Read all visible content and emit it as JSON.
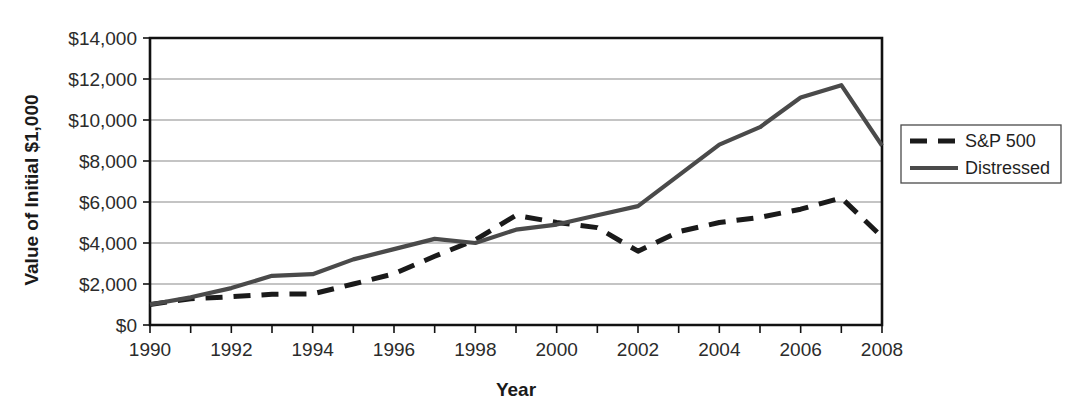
{
  "chart_data": {
    "type": "line",
    "title": "",
    "xlabel": "Year",
    "ylabel": "Value of Initial $1,000",
    "xlim": [
      1990,
      2008
    ],
    "ylim": [
      0,
      14000
    ],
    "grid": true,
    "legend_position": "right",
    "x": [
      1990,
      1991,
      1992,
      1993,
      1994,
      1995,
      1996,
      1997,
      1998,
      1999,
      2000,
      2001,
      2002,
      2003,
      2004,
      2005,
      2006,
      2007,
      2008
    ],
    "xtick_labels": [
      "1990",
      "1992",
      "1994",
      "1996",
      "1998",
      "2000",
      "2002",
      "2004",
      "2006",
      "2008"
    ],
    "xtick_values": [
      1990,
      1992,
      1994,
      1996,
      1998,
      2000,
      2002,
      2004,
      2006,
      2008
    ],
    "ytick_labels": [
      "$0",
      "$2,000",
      "$4,000",
      "$6,000",
      "$8,000",
      "$10,000",
      "$12,000",
      "$14,000"
    ],
    "ytick_values": [
      0,
      2000,
      4000,
      6000,
      8000,
      10000,
      12000,
      14000
    ],
    "series": [
      {
        "name": "S&P 500",
        "style": "dashed",
        "color": "#1a1a1a",
        "values": [
          1000,
          1280,
          1380,
          1500,
          1520,
          2000,
          2500,
          3350,
          4150,
          5350,
          5000,
          4750,
          3600,
          4550,
          5000,
          5250,
          5650,
          6200,
          4300
        ]
      },
      {
        "name": "Distressed",
        "style": "solid",
        "color": "#4a4a4a",
        "values": [
          1000,
          1350,
          1800,
          2400,
          2480,
          3200,
          3700,
          4200,
          4000,
          4650,
          4900,
          5350,
          5800,
          7300,
          8800,
          9650,
          11100,
          11700,
          8750
        ]
      }
    ]
  },
  "legend": {
    "items": [
      {
        "label": "S&P 500",
        "style": "dashed"
      },
      {
        "label": "Distressed",
        "style": "solid"
      }
    ]
  },
  "axes": {
    "y_title": "Value of Initial $1,000",
    "x_title": "Year"
  }
}
